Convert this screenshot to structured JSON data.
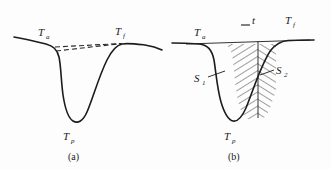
{
  "figure": {
    "background_color": "#fdfdfd",
    "ink_color": "#1c1c1c",
    "panels": [
      {
        "id": "panel-a",
        "caption": "(a)",
        "labels": {
          "onset": {
            "base": "T",
            "sub": "a"
          },
          "final": {
            "base": "T",
            "sub": "f"
          },
          "peak": {
            "base": "T",
            "sub": "p"
          }
        },
        "annotations": {
          "dashed_baseline_upper": "dashed construction line from onset baseline to final point",
          "dashed_baseline_lower": "second dashed construction line forming narrow wedge"
        }
      },
      {
        "id": "panel-b",
        "caption": "(b)",
        "labels": {
          "onset": {
            "base": "T",
            "sub": "a"
          },
          "final": {
            "base": "T",
            "sub": "f"
          },
          "peak": {
            "base": "T",
            "sub": "p"
          },
          "area_left": {
            "base": "S",
            "sub": "1"
          },
          "area_right": {
            "base": "S",
            "sub": "2"
          },
          "time": {
            "base": "t",
            "sub": ""
          }
        },
        "annotations": {
          "hatching_left": "area S1 hatched",
          "hatching_right": "area S2 hatched",
          "divider": "vertical divider at peak separating S1 and S2",
          "tick": "short horizontal tick mark beside t"
        }
      }
    ]
  }
}
